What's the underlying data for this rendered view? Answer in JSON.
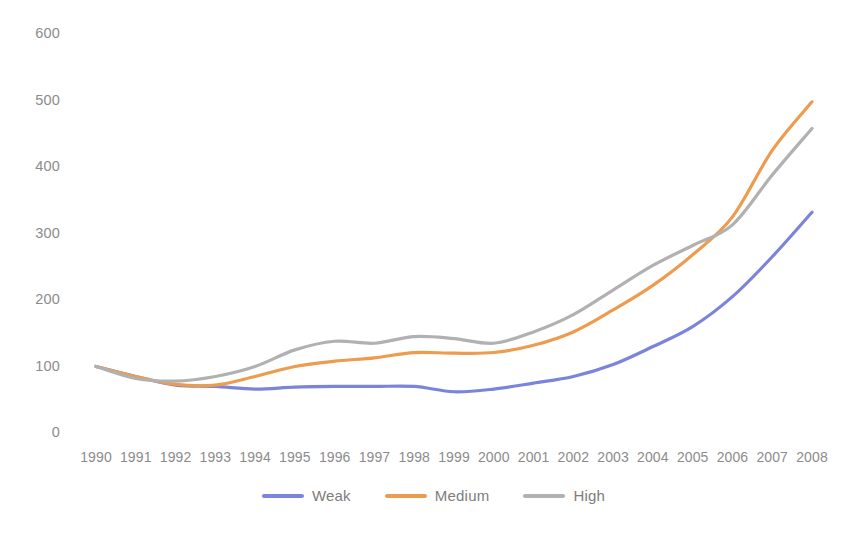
{
  "chart_data": {
    "type": "line",
    "title": "",
    "subtitle": "",
    "xlabel": "",
    "ylabel": "",
    "categories": [
      "1990",
      "1991",
      "1992",
      "1993",
      "1994",
      "1995",
      "1996",
      "1997",
      "1998",
      "1999",
      "2000",
      "2001",
      "2002",
      "2003",
      "2004",
      "2005",
      "2006",
      "2007",
      "2008"
    ],
    "x": [
      1990,
      1991,
      1992,
      1993,
      1994,
      1995,
      1996,
      1997,
      1998,
      1999,
      2000,
      2001,
      2002,
      2003,
      2004,
      2005,
      2006,
      2007,
      2008
    ],
    "series": [
      {
        "name": "Weak",
        "color": "#7B84DB",
        "values": [
          100,
          85,
          72,
          70,
          66,
          69,
          70,
          70,
          70,
          62,
          66,
          75,
          85,
          103,
          130,
          160,
          205,
          265,
          332
        ]
      },
      {
        "name": "Medium",
        "color": "#ED9B4E",
        "values": [
          100,
          85,
          73,
          72,
          85,
          100,
          108,
          113,
          121,
          120,
          121,
          132,
          152,
          185,
          222,
          268,
          325,
          425,
          498
        ]
      },
      {
        "name": "High",
        "color": "#B1B1B1",
        "values": [
          100,
          82,
          78,
          85,
          100,
          125,
          138,
          135,
          145,
          142,
          135,
          152,
          178,
          215,
          252,
          282,
          313,
          388,
          458
        ]
      }
    ],
    "yticks": [
      0,
      100,
      200,
      300,
      400,
      500,
      600
    ],
    "ytick_labels": [
      "0",
      "100",
      "200",
      "300",
      "400",
      "500",
      "600"
    ],
    "ylim": [
      0,
      600
    ],
    "xlim": [
      1990,
      2008
    ],
    "grid": false,
    "legend_position": "bottom"
  },
  "axes": {
    "y_labels": [
      "600",
      "500",
      "400",
      "300",
      "200",
      "100",
      "0"
    ],
    "x_labels": [
      "1990",
      "1991",
      "1992",
      "1993",
      "1994",
      "1995",
      "1996",
      "1997",
      "1998",
      "1999",
      "2000",
      "2001",
      "2002",
      "2003",
      "2004",
      "2005",
      "2006",
      "2007",
      "2008"
    ]
  },
  "legend": {
    "items": [
      {
        "label": "Weak",
        "color": "#7B84DB"
      },
      {
        "label": "Medium",
        "color": "#ED9B4E"
      },
      {
        "label": "High",
        "color": "#B1B1B1"
      }
    ]
  },
  "colors": {
    "weak": "#7B84DB",
    "medium": "#ED9B4E",
    "high": "#B1B1B1",
    "tick_text": "#8c8c8c",
    "background": "#ffffff"
  }
}
